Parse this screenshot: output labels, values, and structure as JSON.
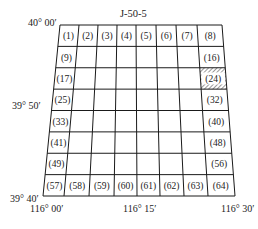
{
  "sheet_title": "J-50-5",
  "latitude_labels": {
    "top": "40° 00′",
    "middle": "39° 50′",
    "bottom": "39° 40′"
  },
  "longitude_labels": {
    "left": "116° 00′",
    "middle": "116° 15′",
    "right": "116° 30′"
  },
  "grid": {
    "rows": 8,
    "cols": 8,
    "line_color": "#1a1a1a",
    "highlighted_cell": "(24)",
    "highlight_style": "diagonal-hatch",
    "labeled_cells": [
      {
        "row": 0,
        "col": 0,
        "label": "(1)"
      },
      {
        "row": 0,
        "col": 1,
        "label": "(2)"
      },
      {
        "row": 0,
        "col": 2,
        "label": "(3)"
      },
      {
        "row": 0,
        "col": 3,
        "label": "(4)"
      },
      {
        "row": 0,
        "col": 4,
        "label": "(5)"
      },
      {
        "row": 0,
        "col": 5,
        "label": "(6)"
      },
      {
        "row": 0,
        "col": 6,
        "label": "(7)"
      },
      {
        "row": 0,
        "col": 7,
        "label": "(8)"
      },
      {
        "row": 1,
        "col": 0,
        "label": "(9)"
      },
      {
        "row": 1,
        "col": 7,
        "label": "(16)"
      },
      {
        "row": 2,
        "col": 0,
        "label": "(17)"
      },
      {
        "row": 2,
        "col": 7,
        "label": "(24)"
      },
      {
        "row": 3,
        "col": 0,
        "label": "(25)"
      },
      {
        "row": 3,
        "col": 7,
        "label": "(32)"
      },
      {
        "row": 4,
        "col": 0,
        "label": "(33)"
      },
      {
        "row": 4,
        "col": 7,
        "label": "(40)"
      },
      {
        "row": 5,
        "col": 0,
        "label": "(41)"
      },
      {
        "row": 5,
        "col": 7,
        "label": "(48)"
      },
      {
        "row": 6,
        "col": 0,
        "label": "(49)"
      },
      {
        "row": 6,
        "col": 7,
        "label": "(56)"
      },
      {
        "row": 7,
        "col": 0,
        "label": "(57)"
      },
      {
        "row": 7,
        "col": 1,
        "label": "(58)"
      },
      {
        "row": 7,
        "col": 2,
        "label": "(59)"
      },
      {
        "row": 7,
        "col": 3,
        "label": "(60)"
      },
      {
        "row": 7,
        "col": 4,
        "label": "(61)"
      },
      {
        "row": 7,
        "col": 5,
        "label": "(62)"
      },
      {
        "row": 7,
        "col": 6,
        "label": "(63)"
      },
      {
        "row": 7,
        "col": 7,
        "label": "(64)"
      }
    ]
  }
}
